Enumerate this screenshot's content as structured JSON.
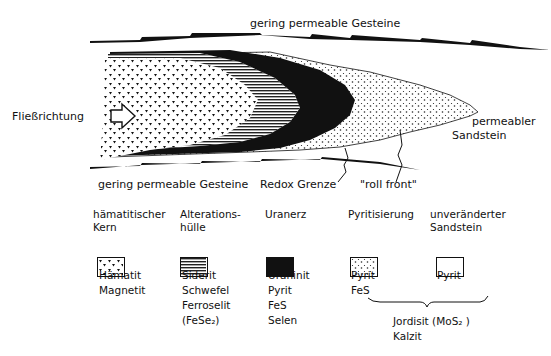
{
  "diagram": {
    "labels": {
      "top_rock": "gering permeable Gesteine",
      "bottom_rock": "gering permeable Gesteine",
      "flow_direction": "Fließrichtung",
      "permeable_line1": "permeabler",
      "permeable_line2": "Sandstein",
      "redox": "Redox Grenze",
      "roll_front": "\"roll front\""
    }
  },
  "legend": [
    {
      "head1": "hämatitischer",
      "head2": "Kern",
      "pattern": "triangles",
      "minerals": [
        "Hämatit",
        "Magnetit"
      ]
    },
    {
      "head1": "Alterations-",
      "head2": "hülle",
      "pattern": "horizontal-lines",
      "minerals": [
        "Siderit",
        "Schwefel",
        "Ferroselit",
        "(FeSe₂)"
      ]
    },
    {
      "head1": "Uranerz",
      "head2": "",
      "pattern": "solid-black",
      "minerals": [
        "Uraninit",
        "Pyrit",
        "FeS",
        "Selen"
      ]
    },
    {
      "head1": "Pyritisierung",
      "head2": "",
      "pattern": "dots",
      "minerals": [
        "Pyrit",
        "FeS"
      ]
    },
    {
      "head1": "unveränderter",
      "head2": "Sandstein",
      "pattern": "blank",
      "minerals": [
        "Pyrit"
      ]
    }
  ],
  "bracket_note": {
    "line1": "Jordisit (MoS₂ )",
    "line2": "Kalzit"
  }
}
